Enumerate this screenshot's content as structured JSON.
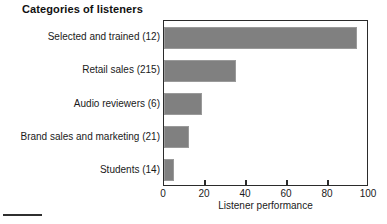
{
  "chart_data": {
    "type": "bar",
    "orientation": "horizontal",
    "title": "Categories of listeners",
    "xlabel": "Listener performance",
    "ylabel": "",
    "categories": [
      "Selected and trained (12)",
      "Retail sales (215)",
      "Audio reviewers (6)",
      "Brand sales and marketing (21)",
      "Students (14)"
    ],
    "values": [
      94,
      35,
      18.5,
      12,
      5
    ],
    "xlim": [
      0,
      100
    ],
    "xticks": [
      0,
      20,
      40,
      60,
      80,
      100
    ],
    "xtick_labels": [
      "0",
      "20",
      "40",
      "60",
      "80",
      "100"
    ],
    "grid": false,
    "legend": false,
    "bar_color": "#808080",
    "bar_edge_color": "#9a9a9a",
    "axis_color": "#2b2b2b",
    "background_color": "#ffffff"
  }
}
